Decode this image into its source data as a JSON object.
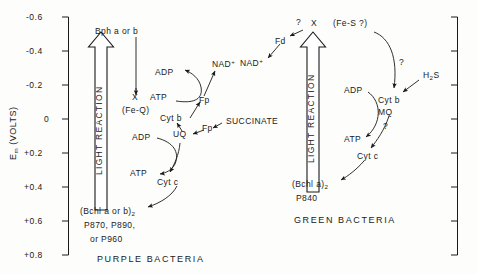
{
  "figure": {
    "axis": {
      "title": "E",
      "title_sub": "m",
      "title_unit": "(VOLTS)",
      "ticks": [
        "-0.6",
        "-0.4",
        "-0.2",
        "0",
        "+0.2",
        "+0.4",
        "+0.6",
        "+0.8"
      ],
      "range_top": "-0.6",
      "range_bottom": "+0.8"
    },
    "panels": [
      {
        "id": "purple",
        "caption": "PURPLE BACTERIA",
        "light_reaction_label": "LIGHT REACTION",
        "nodes": {
          "donor_top": "Bph",
          "donor_top_italic": "a or b",
          "acceptor": "X",
          "acceptor_alt": "(Fe-Q)",
          "adp_upper": "ADP",
          "atp_upper": "ATP",
          "nad": "NAD",
          "nad_charge": "+",
          "fp_upper": "Fp",
          "cyt_b": "Cyt",
          "cyt_b_italic": "b",
          "fp_lower": "Fp",
          "succinate": "SUCCINATE",
          "uq": "UQ",
          "adp_lower": "ADP",
          "atp_lower": "ATP",
          "cyt_c": "Cyt",
          "cyt_c_italic": "c",
          "reaction_center_1": "(Bchl",
          "reaction_center_1_italic": "a or b",
          "reaction_center_1_close": ")",
          "reaction_center_1_sub": "2",
          "reaction_center_2": "P870, P890,",
          "reaction_center_3": "or  P960"
        }
      },
      {
        "id": "green",
        "caption": "GREEN BACTERIA",
        "light_reaction_label": "LIGHT REACTION",
        "nodes": {
          "q_top": "?",
          "acceptor": "X",
          "acceptor_alt": "(Fe-S ?)",
          "fd": "Fd",
          "nad": "NAD",
          "nad_charge": "+",
          "q_right": "?",
          "h2s": "H",
          "h2s_sub": "2",
          "h2s_tail": "S",
          "cyt_b": "Cyt",
          "cyt_b_italic": "b",
          "mq": "MQ",
          "q_lower": "?",
          "adp": "ADP",
          "atp": "ATP",
          "cyt_c": "Cyt",
          "cyt_c_italic": "c",
          "reaction_center_1": "(Bchl",
          "reaction_center_1_italic": "a",
          "reaction_center_1_close": ")",
          "reaction_center_1_sub": "2",
          "reaction_center_2": "P840"
        }
      }
    ]
  }
}
